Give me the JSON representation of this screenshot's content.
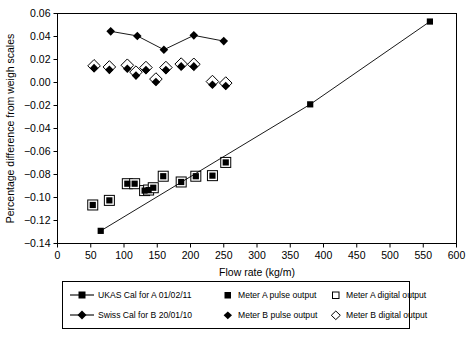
{
  "chart_data": {
    "type": "scatter",
    "title": "",
    "xlabel": "Flow rate (kg/m)",
    "ylabel": "Percentage difference from weigh scales",
    "xlim": [
      0,
      600
    ],
    "ylim": [
      -0.14,
      0.06
    ],
    "xticks": [
      0,
      50,
      100,
      150,
      200,
      250,
      300,
      350,
      400,
      450,
      500,
      550,
      600
    ],
    "xticklabels": [
      "0",
      "50",
      "100",
      "150",
      "200",
      "250",
      "300",
      "350",
      "400",
      "450",
      "500",
      "550",
      "600"
    ],
    "yticks": [
      -0.14,
      -0.12,
      -0.1,
      -0.08,
      -0.06,
      -0.04,
      -0.02,
      0.0,
      0.02,
      0.04,
      0.06
    ],
    "yticklabels": [
      "-0.14",
      "-0.12",
      "-0.10",
      "-0.08",
      "-0.06",
      "-0.04",
      "-0.02",
      "0.00",
      "0.02",
      "0.04",
      "0.06"
    ],
    "grid": false,
    "legend_position": "below",
    "series": [
      {
        "name": "UKAS Cal for A 01/02/11",
        "marker": "filled-square",
        "line": true,
        "points": [
          {
            "x": 65,
            "y": -0.129
          },
          {
            "x": 380,
            "y": -0.019
          },
          {
            "x": 560,
            "y": 0.053
          }
        ]
      },
      {
        "name": "Swiss Cal for B 20/01/10",
        "marker": "filled-diamond",
        "line": true,
        "points": [
          {
            "x": 80,
            "y": 0.0445
          },
          {
            "x": 120,
            "y": 0.0405
          },
          {
            "x": 160,
            "y": 0.0285
          },
          {
            "x": 205,
            "y": 0.041
          },
          {
            "x": 250,
            "y": 0.036
          }
        ]
      },
      {
        "name": "Meter A pulse output",
        "marker": "filled-square",
        "line": false,
        "points": [
          {
            "x": 53,
            "y": -0.1065
          },
          {
            "x": 78,
            "y": -0.1025
          },
          {
            "x": 105,
            "y": -0.088
          },
          {
            "x": 116,
            "y": -0.088
          },
          {
            "x": 131,
            "y": -0.094
          },
          {
            "x": 137,
            "y": -0.0935
          },
          {
            "x": 144,
            "y": -0.0915
          },
          {
            "x": 159,
            "y": -0.0815
          },
          {
            "x": 186,
            "y": -0.0865
          },
          {
            "x": 208,
            "y": -0.0815
          },
          {
            "x": 233,
            "y": -0.081
          },
          {
            "x": 253,
            "y": -0.0695
          }
        ]
      },
      {
        "name": "Meter A digital output",
        "marker": "open-square",
        "line": false,
        "points": [
          {
            "x": 53,
            "y": -0.1065
          },
          {
            "x": 78,
            "y": -0.1025
          },
          {
            "x": 105,
            "y": -0.088
          },
          {
            "x": 116,
            "y": -0.088
          },
          {
            "x": 131,
            "y": -0.094
          },
          {
            "x": 137,
            "y": -0.0935
          },
          {
            "x": 144,
            "y": -0.0915
          },
          {
            "x": 159,
            "y": -0.0815
          },
          {
            "x": 186,
            "y": -0.0865
          },
          {
            "x": 208,
            "y": -0.0815
          },
          {
            "x": 233,
            "y": -0.081
          },
          {
            "x": 253,
            "y": -0.0695
          }
        ]
      },
      {
        "name": "Meter B pulse output",
        "marker": "filled-diamond",
        "line": false,
        "points": [
          {
            "x": 55,
            "y": 0.0125
          },
          {
            "x": 78,
            "y": 0.011
          },
          {
            "x": 105,
            "y": 0.012
          },
          {
            "x": 118,
            "y": 0.006
          },
          {
            "x": 133,
            "y": 0.0108
          },
          {
            "x": 148,
            "y": 0.0005
          },
          {
            "x": 163,
            "y": 0.0108
          },
          {
            "x": 186,
            "y": 0.014
          },
          {
            "x": 205,
            "y": 0.014
          },
          {
            "x": 233,
            "y": -0.002
          },
          {
            "x": 253,
            "y": -0.003
          }
        ]
      },
      {
        "name": "Meter B digital output",
        "marker": "open-diamond",
        "line": false,
        "points": [
          {
            "x": 55,
            "y": 0.0145
          },
          {
            "x": 78,
            "y": 0.0135
          },
          {
            "x": 105,
            "y": 0.015
          },
          {
            "x": 118,
            "y": 0.009
          },
          {
            "x": 133,
            "y": 0.013
          },
          {
            "x": 148,
            "y": 0.003
          },
          {
            "x": 163,
            "y": 0.013
          },
          {
            "x": 186,
            "y": 0.016
          },
          {
            "x": 205,
            "y": 0.0158
          },
          {
            "x": 233,
            "y": 0.0008
          },
          {
            "x": 253,
            "y": -0.0005
          }
        ]
      }
    ]
  },
  "legend": {
    "entries": [
      {
        "label": "UKAS Cal for A 01/02/11",
        "key": "line-filled-square"
      },
      {
        "label": "Meter A pulse output",
        "key": "filled-square"
      },
      {
        "label": "Meter A digital output",
        "key": "open-square"
      },
      {
        "label": "Swiss Cal for B 20/01/10",
        "key": "line-filled-diamond"
      },
      {
        "label": "Meter B pulse output",
        "key": "filled-diamond"
      },
      {
        "label": "Meter B digital output",
        "key": "open-diamond"
      }
    ]
  },
  "colors": {
    "axis": "#000000",
    "marker": "#000000",
    "background": "#ffffff"
  }
}
